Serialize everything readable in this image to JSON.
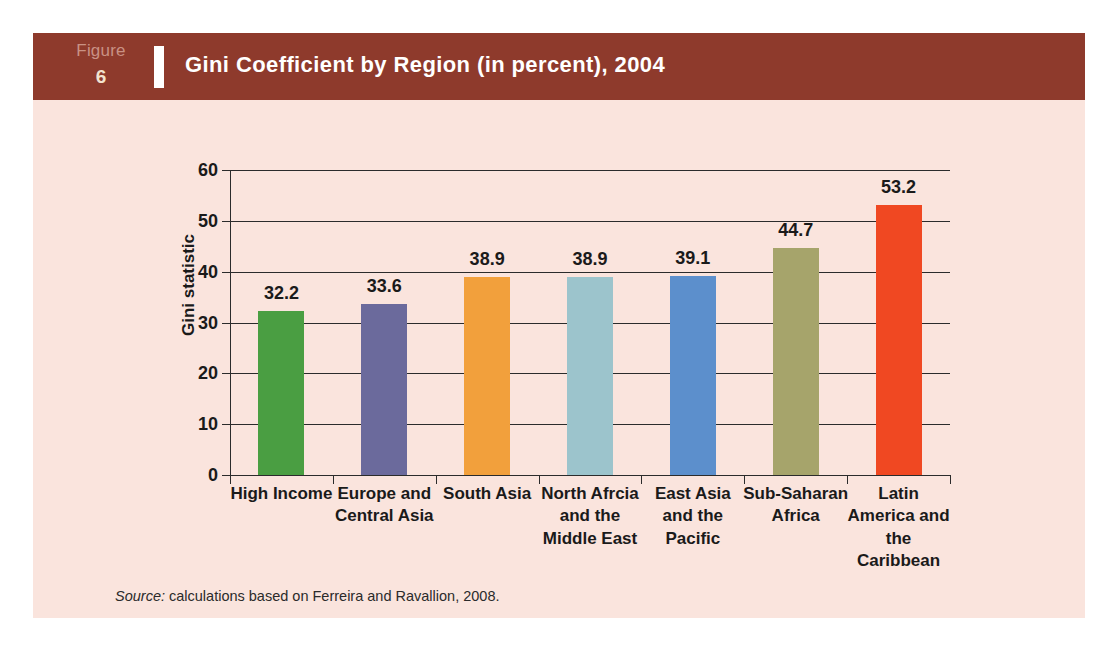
{
  "figure": {
    "kicker": "Figure",
    "number": "6",
    "title": "Gini Coefficient by Region (in percent), 2004",
    "source_lead": "Source:",
    "source_text": " calculations based on Ferreira and Ravallion, 2008."
  },
  "colors": {
    "header_band": "#8e3a2c",
    "panel_background": "#fae4dd",
    "axis": "#2b2b2b",
    "title_text": "#ffffff",
    "kicker_text": "#c99184",
    "number_text": "#f2e3cf"
  },
  "chart_data": {
    "type": "bar",
    "title": "Gini Coefficient by Region (in percent), 2004",
    "xlabel": "",
    "ylabel": "Gini statistic",
    "ylim": [
      0,
      60
    ],
    "yticks": [
      0,
      10,
      20,
      30,
      40,
      50,
      60
    ],
    "grid": true,
    "legend": "none",
    "categories": [
      "High Income",
      "Europe and Central Asia",
      "South Asia",
      "North Afrcia and the Middle East",
      "East Asia and the Pacific",
      "Sub-Saharan Africa",
      "Latin America and the Caribbean"
    ],
    "category_lines": [
      [
        "High Income"
      ],
      [
        "Europe and",
        "Central Asia"
      ],
      [
        "South Asia"
      ],
      [
        "North Afrcia",
        "and the",
        "Middle East"
      ],
      [
        "East Asia",
        "and the",
        "Pacific"
      ],
      [
        "Sub-Saharan",
        "Africa"
      ],
      [
        "Latin",
        "America and",
        "the",
        "Caribbean"
      ]
    ],
    "values": [
      32.2,
      33.6,
      38.9,
      38.9,
      39.1,
      44.7,
      53.2
    ],
    "value_labels": [
      "32.2",
      "33.6",
      "38.9",
      "38.9",
      "39.1",
      "44.7",
      "53.2"
    ],
    "bar_colors": [
      "#4a9e42",
      "#6b6a9c",
      "#f2a03c",
      "#9cc4cc",
      "#5c8fcc",
      "#a6a46b",
      "#f04822"
    ]
  }
}
